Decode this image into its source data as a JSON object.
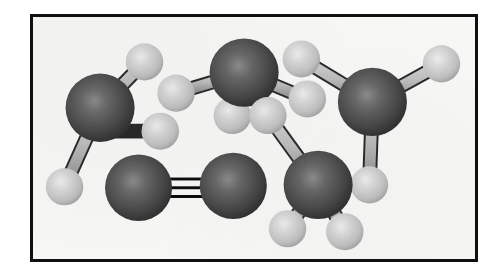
{
  "figure": {
    "kind": "ball-and-stick molecular model illustration",
    "background_color": "#f8f8f6",
    "frame_color": "#101010",
    "page_background": "#ffffff",
    "frame": {
      "x": 30,
      "y": 14,
      "width": 448,
      "height": 248,
      "border_width": 3
    }
  },
  "palette": {
    "heavy_atom_fill": "#4a4a4a",
    "heavy_atom_dark": "#232323",
    "heavy_atom_highlight": "#8f8f8f",
    "hydrogen_fill": "#c9c9c9",
    "hydrogen_dark": "#9a9a9a",
    "hydrogen_highlight": "#f2f2f2",
    "bond_light": "#bdbdbd",
    "bond_dark": "#151515",
    "bond_outline": "#2a2a2a"
  },
  "atoms": [
    {
      "id": "C1",
      "element": "heavy",
      "label": "central atom",
      "cx": 98,
      "cy": 107,
      "r": 35
    },
    {
      "id": "H1a",
      "element": "hydrogen",
      "label": "hydrogen",
      "cx": 143,
      "cy": 60,
      "r": 19
    },
    {
      "id": "H1b",
      "element": "hydrogen",
      "label": "hydrogen",
      "cx": 159,
      "cy": 131,
      "r": 19
    },
    {
      "id": "H1c",
      "element": "hydrogen",
      "label": "hydrogen",
      "cx": 62,
      "cy": 188,
      "r": 19
    },
    {
      "id": "C2",
      "element": "heavy",
      "label": "central atom",
      "cx": 244,
      "cy": 71,
      "r": 35
    },
    {
      "id": "H2a",
      "element": "hydrogen",
      "label": "hydrogen",
      "cx": 175,
      "cy": 92,
      "r": 19
    },
    {
      "id": "H2b",
      "element": "hydrogen",
      "label": "hydrogen",
      "cx": 232,
      "cy": 115,
      "r": 19
    },
    {
      "id": "H2c",
      "element": "hydrogen",
      "label": "hydrogen",
      "cx": 308,
      "cy": 98,
      "r": 19
    },
    {
      "id": "C3",
      "element": "heavy",
      "label": "central atom",
      "cx": 374,
      "cy": 101,
      "r": 35
    },
    {
      "id": "H3a",
      "element": "hydrogen",
      "label": "hydrogen",
      "cx": 302,
      "cy": 57,
      "r": 19
    },
    {
      "id": "H3b",
      "element": "hydrogen",
      "label": "hydrogen",
      "cx": 444,
      "cy": 62,
      "r": 19
    },
    {
      "id": "H3c",
      "element": "hydrogen",
      "label": "hydrogen",
      "cx": 371,
      "cy": 186,
      "r": 19
    },
    {
      "id": "C4",
      "element": "heavy",
      "label": "central atom",
      "cx": 319,
      "cy": 186,
      "r": 35
    },
    {
      "id": "H4a",
      "element": "hydrogen",
      "label": "hydrogen",
      "cx": 268,
      "cy": 115,
      "r": 19
    },
    {
      "id": "H4b",
      "element": "hydrogen",
      "label": "hydrogen",
      "cx": 288,
      "cy": 231,
      "r": 19
    },
    {
      "id": "H4c",
      "element": "hydrogen",
      "label": "hydrogen",
      "cx": 346,
      "cy": 234,
      "r": 19
    },
    {
      "id": "N1",
      "element": "heavy",
      "label": "diatomic atom",
      "cx": 137,
      "cy": 189,
      "r": 34
    },
    {
      "id": "N2",
      "element": "heavy",
      "label": "diatomic atom",
      "cx": 233,
      "cy": 187,
      "r": 34
    }
  ],
  "bonds": [
    {
      "from": "C1",
      "to": "H1a",
      "order": 1
    },
    {
      "from": "C1",
      "to": "H1b",
      "order": 1
    },
    {
      "from": "C1",
      "to": "H1c",
      "order": 1
    },
    {
      "from": "C2",
      "to": "H2a",
      "order": 1
    },
    {
      "from": "C2",
      "to": "H2b",
      "order": 1
    },
    {
      "from": "C2",
      "to": "H2c",
      "order": 1
    },
    {
      "from": "C3",
      "to": "H3a",
      "order": 1
    },
    {
      "from": "C3",
      "to": "H3b",
      "order": 1
    },
    {
      "from": "C3",
      "to": "H3c",
      "order": 1
    },
    {
      "from": "C4",
      "to": "H4a",
      "order": 1
    },
    {
      "from": "C4",
      "to": "H4b",
      "order": 1
    },
    {
      "from": "C4",
      "to": "H4c",
      "order": 1
    },
    {
      "from": "N1",
      "to": "N2",
      "order": 3
    }
  ],
  "molecules": [
    {
      "name": "molecule-upper-left",
      "center_atom": "C1",
      "hydrogens": 3,
      "bond_order": 1
    },
    {
      "name": "molecule-top-middle",
      "center_atom": "C2",
      "hydrogens": 3,
      "bond_order": 1
    },
    {
      "name": "molecule-upper-right",
      "center_atom": "C3",
      "hydrogens": 3,
      "bond_order": 1
    },
    {
      "name": "molecule-lower-right",
      "center_atom": "C4",
      "hydrogens": 3,
      "bond_order": 1
    },
    {
      "name": "molecule-diatomic-triple-bond",
      "center_atom": "N1",
      "hydrogens": 0,
      "bond_order": 3
    }
  ],
  "triple_bond": {
    "line_count": 3,
    "line_thickness": 3,
    "line_gap": 9,
    "color": "#101010"
  }
}
